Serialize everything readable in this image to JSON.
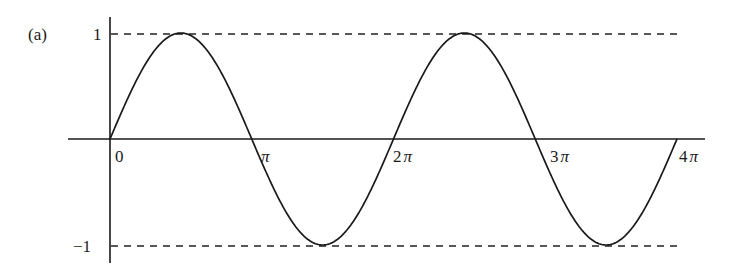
{
  "chart_data": {
    "type": "line",
    "title": "",
    "panel_label": "(a)",
    "function": "sin(x)",
    "x": [
      0,
      0.7854,
      1.5708,
      2.3562,
      3.1416,
      3.927,
      4.7124,
      5.4978,
      6.2832,
      7.0686,
      7.854,
      8.6394,
      9.4248,
      10.2102,
      10.9956,
      11.781,
      12.5664
    ],
    "series": [
      {
        "name": "sin x",
        "values": [
          0,
          0.7071,
          1,
          0.7071,
          0,
          -0.7071,
          -1,
          -0.7071,
          0,
          0.7071,
          1,
          0.7071,
          0,
          -0.7071,
          -1,
          -0.7071,
          0
        ]
      }
    ],
    "xlabel": "",
    "ylabel": "",
    "xlim": [
      0,
      12.5664
    ],
    "ylim": [
      -1,
      1
    ],
    "x_tick_labels": [
      "0",
      "π",
      "2π",
      "3π",
      "4π"
    ],
    "y_tick_labels": [
      "1",
      "−1"
    ],
    "reference_lines": [
      {
        "y": 1,
        "style": "dashed"
      },
      {
        "y": -1,
        "style": "dashed"
      }
    ],
    "grid": false,
    "legend": null
  },
  "labels": {
    "panel": "(a)",
    "y_top": "1",
    "y_bottom": "−1",
    "x_ticks": [
      {
        "num": "0",
        "sym": ""
      },
      {
        "num": "",
        "sym": "π"
      },
      {
        "num": "2",
        "sym": "π"
      },
      {
        "num": "3",
        "sym": "π"
      },
      {
        "num": "4",
        "sym": "π"
      }
    ]
  }
}
